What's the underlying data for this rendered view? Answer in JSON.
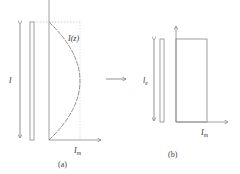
{
  "panel_a": {
    "caption": "(a)",
    "length_label": "l",
    "current_label": "I(z)",
    "axis_label": "I",
    "axis_sub": "m"
  },
  "panel_b": {
    "caption": "(b)",
    "length_label": "l",
    "length_sub": "e",
    "axis_label": "I",
    "axis_sub": "m"
  },
  "colors": {
    "line": "#777777",
    "dotted": "#bbbbbb"
  }
}
